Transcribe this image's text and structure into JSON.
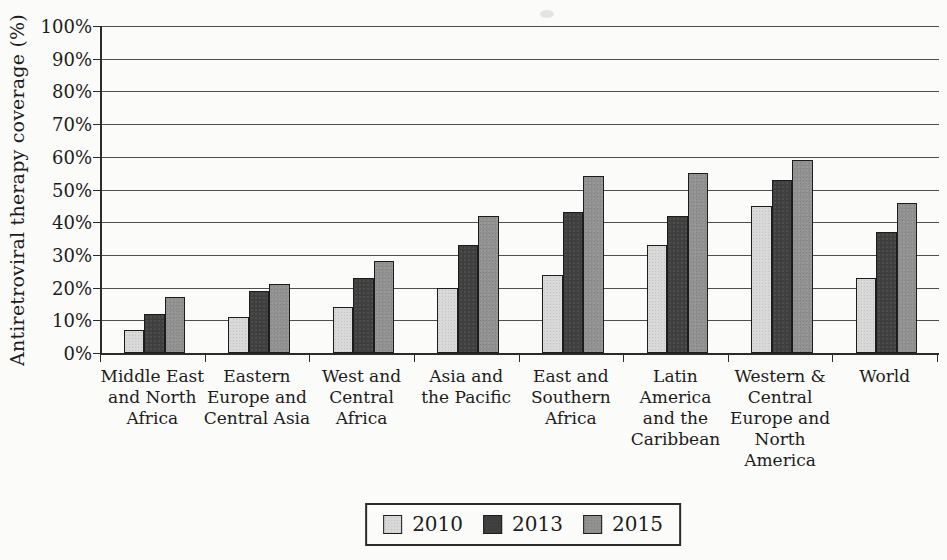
{
  "chart_data": {
    "type": "bar",
    "title": "",
    "ylabel": "Antiretroviral therapy coverage (%)",
    "xlabel": "",
    "ylim": [
      0,
      100
    ],
    "ytick_step": 10,
    "ytick_suffix": "%",
    "grid": true,
    "legend_position": "bottom-center",
    "categories": [
      "Middle East and North Africa",
      "Eastern Europe and Central Asia",
      "West and Central Africa",
      "Asia and the Pacific",
      "East and Southern Africa",
      "Latin America and the Caribbean",
      "Western & Central Europe and North America",
      "World"
    ],
    "categories_display": [
      [
        "Middle East",
        "and North",
        "Africa"
      ],
      [
        "Eastern",
        "Europe and",
        "Central Asia"
      ],
      [
        "West and",
        "Central",
        "Africa"
      ],
      [
        "Asia and",
        "the Pacific"
      ],
      [
        "East and",
        "Southern",
        "Africa"
      ],
      [
        "Latin",
        "America",
        "and the",
        "Caribbean"
      ],
      [
        "Western &",
        "Central",
        "Europe and",
        "North",
        "America"
      ],
      [
        "World"
      ]
    ],
    "series": [
      {
        "name": "2010",
        "color": "#d8d8d8",
        "values": [
          7,
          11,
          14,
          20,
          24,
          33,
          45,
          23
        ]
      },
      {
        "name": "2013",
        "color": "#404040",
        "values": [
          12,
          19,
          23,
          33,
          43,
          42,
          53,
          37
        ]
      },
      {
        "name": "2015",
        "color": "#919191",
        "values": [
          17,
          21,
          28,
          42,
          54,
          55,
          59,
          46
        ]
      }
    ],
    "colors": {
      "bar_border": "#1c1c1c",
      "gridline": "#4f4f4f",
      "axis": "#2b2b2b",
      "text": "#1c1c1c",
      "legend_border": "#2b2b2b",
      "background": "#fbfbf9"
    }
  }
}
